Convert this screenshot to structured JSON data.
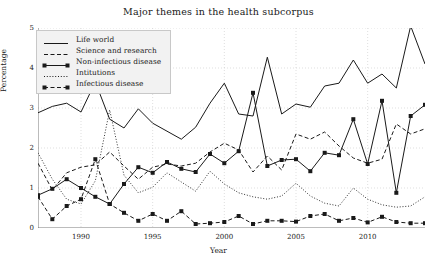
{
  "chart_data": {
    "type": "line",
    "title": "Major themes in the health subcorpus",
    "xlabel": "Year",
    "ylabel": "Percentage",
    "xlim": [
      1987,
      2014
    ],
    "ylim": [
      0,
      5
    ],
    "xticks": [
      1990,
      1995,
      2000,
      2005,
      2010
    ],
    "yticks": [
      0,
      1,
      2,
      3,
      4,
      5
    ],
    "grid": true,
    "legend_position": "upper left",
    "x": [
      1987,
      1988,
      1989,
      1990,
      1991,
      1992,
      1993,
      1994,
      1995,
      1996,
      1997,
      1998,
      1999,
      2000,
      2001,
      2002,
      2003,
      2004,
      2005,
      2006,
      2007,
      2008,
      2009,
      2010,
      2011,
      2012,
      2013,
      2014
    ],
    "series": [
      {
        "name": "Life world",
        "style": "solid",
        "marker": "none",
        "values": [
          2.88,
          3.04,
          3.12,
          2.9,
          3.65,
          2.72,
          2.5,
          2.98,
          2.62,
          2.42,
          2.22,
          2.52,
          3.12,
          3.62,
          2.85,
          2.8,
          4.27,
          2.85,
          3.1,
          3.02,
          3.55,
          3.62,
          4.2,
          3.62,
          3.85,
          3.5,
          5.05,
          4.1
        ]
      },
      {
        "name": "Science and research",
        "style": "dashed",
        "marker": "none",
        "values": [
          1.62,
          0.95,
          1.38,
          1.52,
          1.58,
          1.9,
          1.55,
          1.22,
          1.52,
          1.6,
          1.55,
          1.62,
          1.9,
          2.12,
          1.95,
          1.4,
          1.8,
          1.45,
          2.35,
          2.22,
          2.4,
          2.05,
          1.75,
          1.62,
          1.72,
          2.6,
          2.35,
          2.48
        ]
      },
      {
        "name": "Non-infectious disease",
        "style": "solid",
        "marker": "square",
        "values": [
          0.82,
          0.98,
          1.22,
          1.0,
          0.78,
          0.6,
          1.1,
          1.52,
          1.38,
          1.65,
          1.48,
          1.4,
          1.85,
          1.62,
          1.92,
          3.38,
          1.55,
          1.7,
          1.72,
          1.42,
          1.88,
          1.82,
          2.72,
          1.6,
          3.18,
          0.88,
          2.8,
          3.08
        ]
      },
      {
        "name": "Intitutions",
        "style": "dotted",
        "marker": "none",
        "values": [
          1.88,
          1.22,
          0.72,
          0.6,
          1.18,
          2.95,
          1.32,
          0.88,
          1.02,
          1.38,
          1.15,
          0.92,
          1.42,
          1.1,
          0.88,
          0.78,
          0.72,
          0.8,
          1.12,
          0.8,
          0.62,
          0.55,
          1.0,
          0.72,
          0.58,
          0.52,
          0.55,
          0.78
        ]
      },
      {
        "name": "Infectious disease",
        "style": "dashed",
        "marker": "square",
        "values": [
          0.78,
          0.22,
          0.55,
          0.72,
          1.72,
          0.6,
          0.38,
          0.18,
          0.35,
          0.18,
          0.42,
          0.1,
          0.12,
          0.15,
          0.3,
          0.1,
          0.18,
          0.18,
          0.16,
          0.3,
          0.35,
          0.18,
          0.25,
          0.14,
          0.28,
          0.15,
          0.12,
          0.12
        ]
      }
    ]
  },
  "axis": {
    "yticklabels": [
      "0",
      "1",
      "2",
      "3",
      "4",
      "5"
    ],
    "xticklabels": [
      "1990",
      "1995",
      "2000",
      "2005",
      "2010"
    ]
  },
  "legend": {
    "items": [
      {
        "label": "Life world"
      },
      {
        "label": "Science and research"
      },
      {
        "label": "Non-infectious disease"
      },
      {
        "label": "Intitutions"
      },
      {
        "label": "Infectious disease"
      }
    ]
  },
  "colors": {
    "line": "#1a1a1a",
    "grid": "#c9c9c9",
    "legend_bg": "#f2f2f2"
  }
}
